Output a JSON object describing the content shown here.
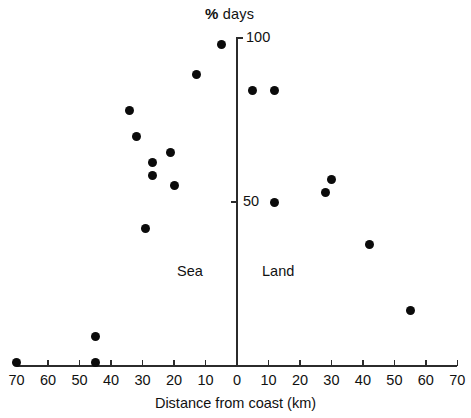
{
  "chart_data": {
    "type": "scatter",
    "title": "",
    "xlabel": "Distance from coast (km)",
    "ylabel": "% days",
    "ylabel_prefix": "%",
    "ylabel_suffix": "days",
    "xlim": [
      -70,
      70
    ],
    "ylim": [
      0,
      100
    ],
    "grid": false,
    "legend_position": "none",
    "y_ticks": [
      {
        "value": 100,
        "label": "100"
      },
      {
        "value": 50,
        "label": "50"
      }
    ],
    "x_ticks": [
      {
        "position": -70,
        "label": "70"
      },
      {
        "position": -60,
        "label": "60"
      },
      {
        "position": -50,
        "label": "50"
      },
      {
        "position": -40,
        "label": "40"
      },
      {
        "position": -30,
        "label": "30"
      },
      {
        "position": -20,
        "label": "20"
      },
      {
        "position": -10,
        "label": "10"
      },
      {
        "position": 0,
        "label": "0"
      },
      {
        "position": 10,
        "label": "10"
      },
      {
        "position": 20,
        "label": "20"
      },
      {
        "position": 30,
        "label": "30"
      },
      {
        "position": 40,
        "label": "40"
      },
      {
        "position": 50,
        "label": "50"
      },
      {
        "position": 60,
        "label": "60"
      },
      {
        "position": 70,
        "label": "70"
      }
    ],
    "annotations": [
      {
        "text": "Sea",
        "x": -18,
        "y": 29
      },
      {
        "text": "Land",
        "x": 10,
        "y": 29
      }
    ],
    "series": [
      {
        "name": "Sea",
        "side": "sea",
        "points": [
          {
            "x": -5,
            "y": 98
          },
          {
            "x": -13,
            "y": 89
          },
          {
            "x": -34,
            "y": 78
          },
          {
            "x": -32,
            "y": 70
          },
          {
            "x": -21,
            "y": 65
          },
          {
            "x": -27,
            "y": 62
          },
          {
            "x": -27,
            "y": 58
          },
          {
            "x": -20,
            "y": 55
          },
          {
            "x": -29,
            "y": 42
          },
          {
            "x": -45,
            "y": 9
          },
          {
            "x": -45,
            "y": 1
          },
          {
            "x": -70,
            "y": 1
          }
        ]
      },
      {
        "name": "Land",
        "side": "land",
        "points": [
          {
            "x": 5,
            "y": 84
          },
          {
            "x": 12,
            "y": 84
          },
          {
            "x": 30,
            "y": 57
          },
          {
            "x": 28,
            "y": 53
          },
          {
            "x": 12,
            "y": 50
          },
          {
            "x": 42,
            "y": 37
          },
          {
            "x": 55,
            "y": 17
          }
        ]
      }
    ]
  },
  "labels": {
    "y_axis_title": "% days",
    "y_axis_title_pct": "%",
    "y_axis_title_rest": "days",
    "x_axis_title": "Distance from coast (km)",
    "sea": "Sea",
    "land": "Land",
    "tick_100": "100",
    "tick_50": "50"
  },
  "colors": {
    "marker": "#0b0b0b",
    "axis": "#2b2b2b",
    "text": "#111111",
    "background": "#ffffff"
  }
}
